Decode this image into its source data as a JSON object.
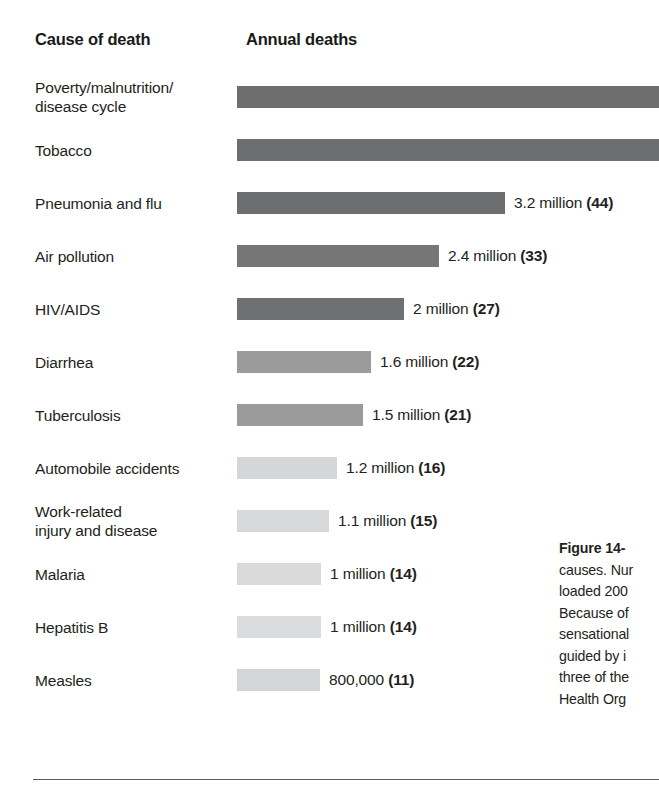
{
  "header": {
    "cause_label": "Cause of death",
    "annual_label": "Annual deaths"
  },
  "caption": {
    "figure_number": "Figure 14-",
    "lines": [
      "causes. Nur",
      "loaded 200",
      "Because of",
      "sensational",
      "guided by i",
      "three of the",
      "Health Org"
    ]
  },
  "chart_data": {
    "type": "bar",
    "orientation": "horizontal",
    "title": "Annual deaths",
    "xlabel": "",
    "ylabel": "Cause of death",
    "units": "deaths per year",
    "note": "Number in parentheses is deaths per 1000 (rate index shown in bold).",
    "grid": false,
    "legend": "none",
    "categories": [
      "Poverty/malnutrition/\ndisease cycle",
      "Tobacco",
      "Pneumonia and flu",
      "Air pollution",
      "HIV/AIDS",
      "Diarrhea",
      "Tuberculosis",
      "Automobile accidents",
      "Work-related\ninjury and disease",
      "Malaria",
      "Hepatitis B",
      "Measles"
    ],
    "values": [
      null,
      null,
      3200000,
      2400000,
      2000000,
      1600000,
      1500000,
      1200000,
      1100000,
      1000000,
      1000000,
      800000
    ],
    "value_labels": [
      "",
      "",
      "3.2 million",
      "2.4 million",
      "2 million",
      "1.6 million",
      "1.5 million",
      "1.2 million",
      "1.1 million",
      "1 million",
      "1 million",
      "800,000"
    ],
    "paren_values": [
      "",
      "",
      "(44)",
      "(33)",
      "(27)",
      "(22)",
      "(21)",
      "(16)",
      "(15)",
      "(14)",
      "(14)",
      "(11)"
    ],
    "bar_pixel_widths": [
      422,
      422,
      268,
      202,
      167,
      134,
      126,
      100,
      92,
      84,
      84,
      68
    ],
    "bar_colors": [
      "#6d6e70",
      "#6d6e70",
      "#6d6e70",
      "#757678",
      "#6f7072",
      "#9b9b9b",
      "#9b9b9b",
      "#d5d6d7",
      "#d7d8d9",
      "#d9dadb",
      "#dadbdc",
      "#d4d5d6"
    ],
    "truncated_bars": [
      0,
      1
    ]
  },
  "rows": [
    {
      "label": "Poverty/malnutrition/\ndisease cycle",
      "value_label": "",
      "paren": "",
      "width": 422,
      "color": "#6d6e70"
    },
    {
      "label": "Tobacco",
      "value_label": "",
      "paren": "",
      "width": 422,
      "color": "#6d6e70"
    },
    {
      "label": "Pneumonia and flu",
      "value_label": "3.2 million",
      "paren": "(44)",
      "width": 268,
      "color": "#6d6e70"
    },
    {
      "label": "Air pollution",
      "value_label": "2.4 million",
      "paren": "(33)",
      "width": 202,
      "color": "#757678"
    },
    {
      "label": "HIV/AIDS",
      "value_label": "2 million",
      "paren": "(27)",
      "width": 167,
      "color": "#6f7072"
    },
    {
      "label": "Diarrhea",
      "value_label": "1.6 million",
      "paren": "(22)",
      "width": 134,
      "color": "#9b9b9b"
    },
    {
      "label": "Tuberculosis",
      "value_label": "1.5 million",
      "paren": "(21)",
      "width": 126,
      "color": "#9b9b9b"
    },
    {
      "label": "Automobile accidents",
      "value_label": "1.2 million",
      "paren": "(16)",
      "width": 100,
      "color": "#d5d6d7"
    },
    {
      "label": "Work-related\ninjury and disease",
      "value_label": "1.1 million",
      "paren": "(15)",
      "width": 92,
      "color": "#d7d8d9"
    },
    {
      "label": "Malaria",
      "value_label": "1 million",
      "paren": "(14)",
      "width": 84,
      "color": "#d9dadb"
    },
    {
      "label": "Hepatitis B",
      "value_label": "1 million",
      "paren": "(14)",
      "width": 84,
      "color": "#dadbdc"
    },
    {
      "label": "Measles",
      "value_label": "800,000",
      "paren": "(11)",
      "width": 83,
      "color": "#d4d5d6"
    }
  ]
}
